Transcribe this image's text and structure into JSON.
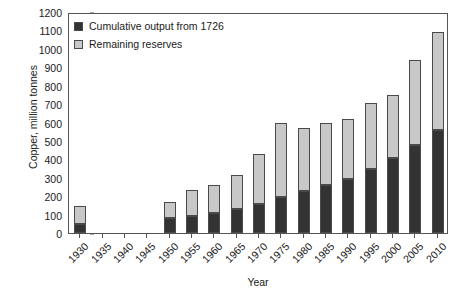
{
  "chart_data": {
    "type": "bar",
    "title": "",
    "subtitle": "",
    "xlabel": "Year",
    "ylabel": "Copper, million tonnes",
    "ylim": [
      0,
      1200
    ],
    "ytick_step": 100,
    "yticks": [
      0,
      100,
      200,
      300,
      400,
      500,
      600,
      700,
      800,
      900,
      1000,
      1100,
      1200
    ],
    "grid": false,
    "stacked": true,
    "legend_position": "top-left",
    "categories": [
      "1930",
      "1935",
      "1940",
      "1945",
      "1950",
      "1955",
      "1960",
      "1965",
      "1970",
      "1975",
      "1980",
      "1985",
      "1990",
      "1995",
      "2000",
      "2005",
      "2010"
    ],
    "series": [
      {
        "name": "Cumulative output from 1726",
        "color": "#333333",
        "values": [
          48,
          null,
          null,
          null,
          80,
          95,
          110,
          130,
          155,
          195,
          230,
          260,
          295,
          345,
          410,
          480,
          560
        ]
      },
      {
        "name": "Remaining reserves",
        "color": "#c8c8c8",
        "values": [
          100,
          null,
          null,
          null,
          90,
          140,
          150,
          185,
          275,
          405,
          340,
          340,
          325,
          360,
          340,
          460,
          530
        ]
      }
    ],
    "totals": [
      148,
      null,
      null,
      null,
      170,
      235,
      260,
      315,
      430,
      600,
      570,
      600,
      620,
      705,
      750,
      940,
      1090
    ],
    "annotations": []
  },
  "legend": {
    "items": [
      {
        "label": "Cumulative output from 1726",
        "swatch": "#333333"
      },
      {
        "label": "Remaining reserves",
        "swatch": "#c8c8c8"
      }
    ]
  }
}
